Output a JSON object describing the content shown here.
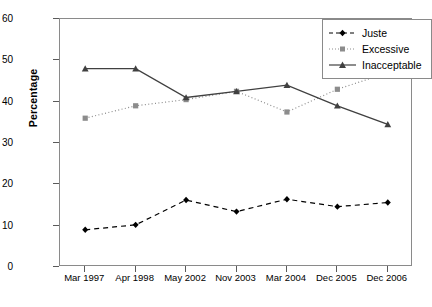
{
  "chart_data": {
    "type": "line",
    "title": "",
    "xlabel": "",
    "ylabel": "Percentage",
    "categories": [
      "Mar 1997",
      "Apr 1998",
      "May 2002",
      "Nov 2003",
      "Mar 2004",
      "Dec 2005",
      "Dec 2006"
    ],
    "ylim": [
      0,
      60
    ],
    "yticks": [
      0,
      10,
      20,
      30,
      40,
      50,
      60
    ],
    "grid": false,
    "legend_position": "top-right",
    "series": [
      {
        "name": "Juste",
        "marker": "diamond",
        "line_style": "dashed",
        "color": "#000000",
        "values": [
          9.0,
          10.2,
          16.2,
          13.4,
          16.4,
          14.6,
          15.6
        ]
      },
      {
        "name": "Excessive",
        "marker": "square",
        "line_style": "dotted",
        "color": "#8c8c8c",
        "values": [
          36.0,
          39.0,
          40.5,
          42.5,
          37.5,
          43.0,
          47.0
        ]
      },
      {
        "name": "Inacceptable",
        "marker": "triangle",
        "line_style": "solid",
        "color": "#404040",
        "values": [
          48.0,
          48.0,
          41.0,
          42.5,
          44.0,
          39.0,
          34.5
        ]
      }
    ]
  },
  "legend": {
    "items": [
      {
        "label": "Juste"
      },
      {
        "label": "Excessive"
      },
      {
        "label": "Inacceptable"
      }
    ]
  },
  "axis": {
    "y_title": "Percentage",
    "y_tick_labels": [
      "60",
      "50",
      "40",
      "30",
      "20",
      "10",
      "0"
    ],
    "x_tick_labels": [
      "Mar 1997",
      "Apr 1998",
      "May 2002",
      "Nov 2003",
      "Mar 2004",
      "Dec 2005",
      "Dec 2006"
    ]
  }
}
